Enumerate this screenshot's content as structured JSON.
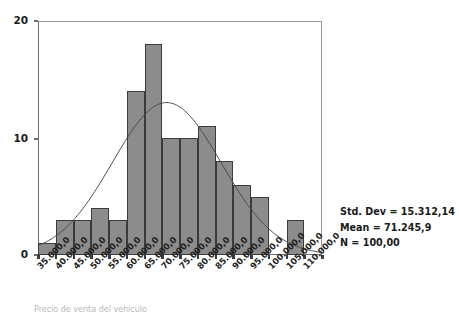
{
  "chart_data": {
    "type": "bar",
    "title": "",
    "subtitle": "",
    "xlabel": "",
    "ylabel": "",
    "ylim": [
      0,
      20
    ],
    "grid": false,
    "legend": "none",
    "bin_width": 5000,
    "categories": [
      "35.000,0",
      "40.000,0",
      "45.000,0",
      "50.000,0",
      "55.000,0",
      "60.000,0",
      "65.000,0",
      "70.000,0",
      "75.000,0",
      "80.000,0",
      "85.000,0",
      "90.000,0",
      "95.000,0",
      "100.000,0",
      "105.000,0",
      "110.000,0"
    ],
    "values": [
      1,
      3,
      3,
      4,
      3,
      14,
      18,
      10,
      10,
      11,
      8,
      6,
      5,
      0,
      3,
      0
    ],
    "yticks": [
      0,
      10,
      20
    ],
    "ytick_labels": [
      "0",
      "10",
      "20"
    ],
    "xtick_labels": [
      "35.000,0",
      "40.000,0",
      "45.000,0",
      "50.000,0",
      "55.000,0",
      "60.000,0",
      "65.000,0",
      "70.000,0",
      "75.000,0",
      "80.000,0",
      "85.000,0",
      "90.000,0",
      "95.000,0",
      "100.000,0",
      "105.000,0",
      "110.000,0"
    ],
    "overlay": {
      "type": "normal-curve",
      "mean": 71245.9,
      "std_dev": 15312.14,
      "n": 100
    },
    "colors": {
      "bar_fill": "#8c8c8c",
      "bar_edge": "#3b3b3b",
      "curve": "#4a4a4a",
      "axis": "#6e6e6e",
      "text": "#1a1a1a",
      "background": "#ffffff"
    }
  },
  "stats": {
    "std_dev_label": "Std. Dev = 15.312,14",
    "mean_label": "Mean = 71.245,9",
    "n_label": "N = 100,00"
  },
  "caption": {
    "text": "Precio de venta del vehículo"
  }
}
